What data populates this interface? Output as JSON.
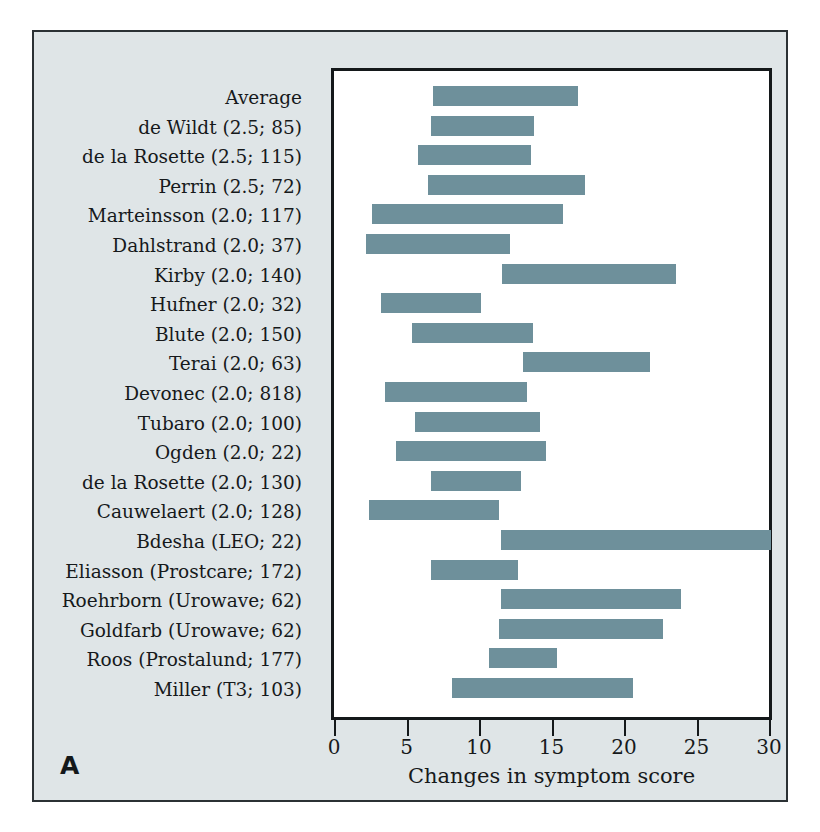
{
  "panel": {
    "letter": "A",
    "background_color": "#dfe5e7",
    "bar_color": "#6e909b",
    "border_color": "#14181a"
  },
  "chart_data": {
    "type": "bar",
    "orientation": "horizontal",
    "subtype": "floating-range-bar",
    "title": "",
    "xlabel": "Changes in symptom score",
    "ylabel": "",
    "xlim": [
      0,
      30
    ],
    "xticks": [
      0,
      5,
      10,
      15,
      20,
      25,
      30
    ],
    "xtick_labels": [
      "0",
      "5",
      "10",
      "15",
      "20",
      "25",
      "30"
    ],
    "grid": false,
    "legend": null,
    "categories": [
      "Average",
      "de Wildt (2.5; 85)",
      "de la Rosette (2.5; 115)",
      "Perrin (2.5; 72)",
      "Marteinsson (2.0; 117)",
      "Dahlstrand (2.0; 37)",
      "Kirby (2.0; 140)",
      "Hufner (2.0; 32)",
      "Blute (2.0; 150)",
      "Terai (2.0; 63)",
      "Devonec (2.0; 818)",
      "Tubaro (2.0; 100)",
      "Ogden (2.0; 22)",
      "de la Rosette (2.0; 130)",
      "Cauwelaert (2.0; 128)",
      "Bdesha (LEO; 22)",
      "Eliasson (Prostcare; 172)",
      "Roehrborn (Urowave; 62)",
      "Goldfarb (Urowave; 62)",
      "Roos (Prostalund; 177)",
      "Miller (T3; 103)"
    ],
    "bars": [
      {
        "label": "Average",
        "start": 6.6,
        "end": 16.6
      },
      {
        "label": "de Wildt (2.5; 85)",
        "start": 6.5,
        "end": 13.6
      },
      {
        "label": "de la Rosette (2.5; 115)",
        "start": 5.6,
        "end": 13.4
      },
      {
        "label": "Perrin (2.5; 72)",
        "start": 6.3,
        "end": 17.1
      },
      {
        "label": "Marteinsson (2.0; 117)",
        "start": 2.4,
        "end": 15.6
      },
      {
        "label": "Dahlstrand (2.0; 37)",
        "start": 2.0,
        "end": 11.9
      },
      {
        "label": "Kirby (2.0; 140)",
        "start": 11.4,
        "end": 23.4
      },
      {
        "label": "Hufner (2.0; 32)",
        "start": 3.0,
        "end": 9.9
      },
      {
        "label": "Blute (2.0; 150)",
        "start": 5.2,
        "end": 13.5
      },
      {
        "label": "Terai (2.0; 63)",
        "start": 12.8,
        "end": 21.6
      },
      {
        "label": "Devonec (2.0; 818)",
        "start": 3.3,
        "end": 13.1
      },
      {
        "label": "Tubaro (2.0; 100)",
        "start": 5.4,
        "end": 14.0
      },
      {
        "label": "Ogden (2.0; 22)",
        "start": 4.1,
        "end": 14.4
      },
      {
        "label": "de la Rosette (2.0; 130)",
        "start": 6.5,
        "end": 12.7
      },
      {
        "label": "Cauwelaert (2.0; 128)",
        "start": 2.2,
        "end": 11.2
      },
      {
        "label": "Bdesha (LEO; 22)",
        "start": 11.3,
        "end": 29.9
      },
      {
        "label": "Eliasson (Prostcare; 172)",
        "start": 6.5,
        "end": 12.5
      },
      {
        "label": "Roehrborn (Urowave; 62)",
        "start": 11.3,
        "end": 23.7
      },
      {
        "label": "Goldfarb (Urowave; 62)",
        "start": 11.2,
        "end": 22.5
      },
      {
        "label": "Roos (Prostalund; 177)",
        "start": 10.5,
        "end": 15.2
      },
      {
        "label": "Miller (T3; 103)",
        "start": 7.9,
        "end": 20.4
      }
    ]
  }
}
